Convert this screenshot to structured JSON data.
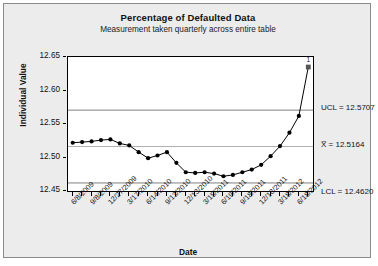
{
  "chart_data": {
    "type": "line",
    "title": "Percentage of Defaulted Data",
    "subtitle": "Measurement taken quarterly across entire table",
    "xlabel": "Date",
    "ylabel": "Individual Value",
    "ylim": [
      12.45,
      12.65
    ],
    "ytick_labels": [
      "12.65",
      "12.60",
      "12.55",
      "12.50",
      "12.45"
    ],
    "ytick_values": [
      12.65,
      12.6,
      12.55,
      12.5,
      12.45
    ],
    "grid": false,
    "legend": "none",
    "x_tick_labels": [
      "6/8/2009",
      "9/8/2009",
      "12/27/2009",
      "3/17/2010",
      "6/14/2010",
      "9/13/2010",
      "12/13/2010",
      "3/15/2011",
      "6/19/2011",
      "9/18/2011",
      "12/18/2011",
      "3/18/2012",
      "6/18/2012"
    ],
    "n_points": 26,
    "values": [
      12.522,
      12.523,
      12.524,
      12.526,
      12.527,
      12.521,
      12.518,
      12.508,
      12.499,
      12.503,
      12.508,
      12.492,
      12.478,
      12.477,
      12.478,
      12.476,
      12.472,
      12.474,
      12.478,
      12.482,
      12.489,
      12.502,
      12.517,
      12.537,
      12.562,
      12.635
    ],
    "control_limits": {
      "ucl": 12.5707,
      "center": 12.5164,
      "lcl": 12.462,
      "ucl_label": "UCL = 12.5707",
      "center_label": "X̅ = 12.5164",
      "lcl_label": "LCL = 12.4620"
    },
    "violations": [
      {
        "index": 26,
        "label": "1",
        "value": 12.635,
        "marker": "square"
      }
    ],
    "colors": {
      "panel_background": "#ececed",
      "plot_background": "#ffffff",
      "series": "#000000",
      "limit_line": "#808080",
      "center_line": "#b0b0b0",
      "violation": "#555555"
    }
  }
}
